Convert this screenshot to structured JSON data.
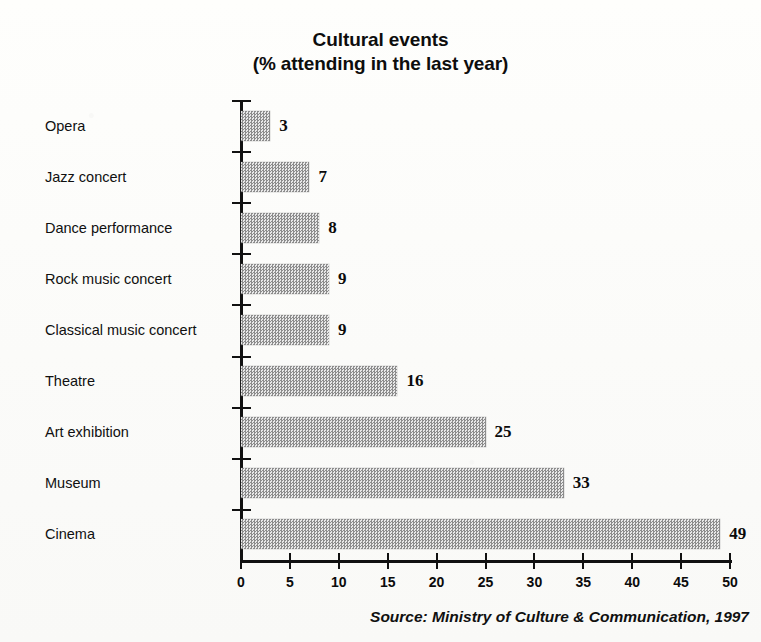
{
  "title": {
    "line1": "Cultural events",
    "line2": "(% attending in the last year)"
  },
  "source": "Source: Ministry of Culture & Communication, 1997",
  "colors": {
    "bar_fill": "#b9b9b9",
    "bar_dither_dark": "#8c8c8c",
    "bar_dither_light": "#e8e8e8",
    "axis": "#111111",
    "text": "#101010",
    "background": "#fdfdfb"
  },
  "chart_data": {
    "type": "bar",
    "orientation": "horizontal",
    "title": "Cultural events\n(% attending in the last year)",
    "xlabel": "",
    "ylabel": "",
    "categories": [
      "Opera",
      "Jazz concert",
      "Dance performance",
      "Rock music concert",
      "Classical music concert",
      "Theatre",
      "Art exhibition",
      "Museum",
      "Cinema"
    ],
    "values": [
      3,
      7,
      8,
      9,
      9,
      16,
      25,
      33,
      49
    ],
    "value_labels": [
      "3",
      "7",
      "8",
      "9",
      "9",
      "16",
      "25",
      "33",
      "49"
    ],
    "xlim": [
      0,
      50
    ],
    "xticks": [
      0,
      5,
      10,
      15,
      20,
      25,
      30,
      35,
      40,
      45,
      50
    ],
    "xtick_labels": [
      "0",
      "5",
      "10",
      "15",
      "20",
      "25",
      "30",
      "35",
      "40",
      "45",
      "50"
    ],
    "grid": false,
    "legend": false,
    "annotations": [
      "Source: Ministry of Culture & Communication, 1997"
    ]
  }
}
